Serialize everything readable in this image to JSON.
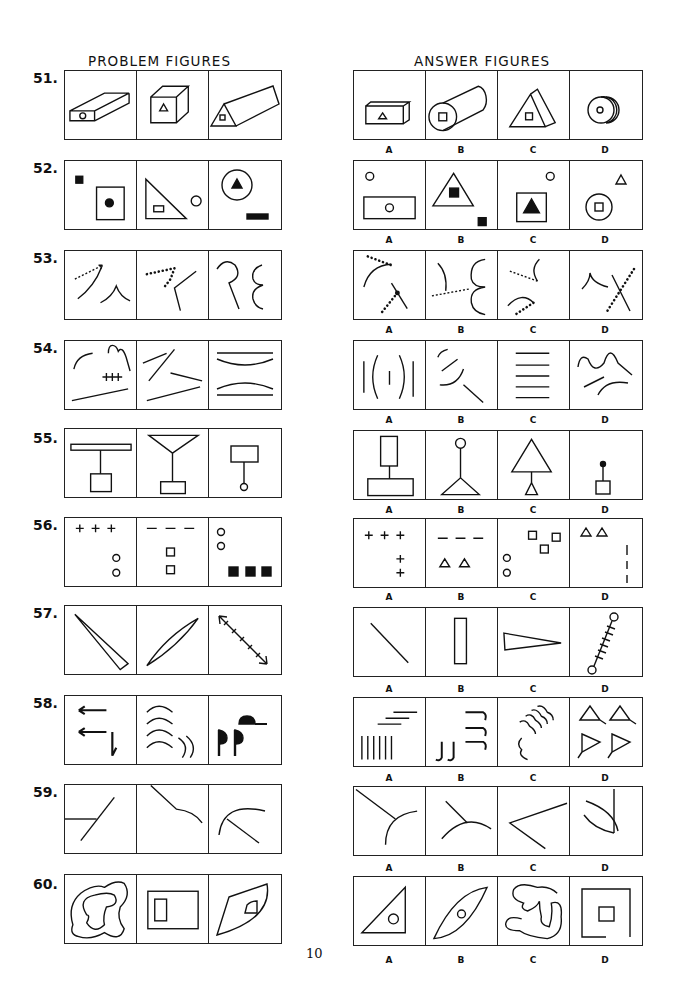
{
  "headers": {
    "problem": "PROBLEM FIGURES",
    "answer": "ANSWER FIGURES"
  },
  "page_number": "10",
  "answer_labels": [
    "A",
    "B",
    "C",
    "D"
  ],
  "questions": [
    {
      "number": "51.",
      "problem": [
        "flat box with circle on end face",
        "cube with triangle on front face",
        "triangular prism with square on end face"
      ],
      "answers": [
        "box with triangle",
        "cylinder with square on end",
        "triangular prism with square",
        "disc with circle"
      ]
    },
    {
      "number": "52.",
      "problem": [
        "small black square; square with black dot",
        "triangle with small rectangle; small circle",
        "circle with black triangle; black bar"
      ],
      "answers": [
        "circle; rectangle with circle",
        "triangle with black square; black square",
        "circle; square with black triangle",
        "triangle; circle with square"
      ]
    },
    {
      "number": "53.",
      "problem": [
        "dashed arrow, arc, peak",
        "dotted angle, bent line",
        "R-curve, epsilon curve"
      ],
      "answers": [
        "dotted arc, dotted line across line",
        "arc, dashed line, double arc",
        "dashed line with arc, dotted arc",
        "peak arc, dotted line across line"
      ]
    },
    {
      "number": "54.",
      "problem": [
        "arc, squiggle, hatched line, long line",
        "crossed lines, two lines",
        "lines with arcs"
      ],
      "answers": [
        "vertical lines and parentheses",
        "arcs and lines",
        "five horizontal lines",
        "wave and arcs"
      ]
    },
    {
      "number": "55.",
      "problem": [
        "bar on stem to square",
        "funnel on stem to rectangle",
        "rectangle on stem to circle"
      ],
      "answers": [
        "rectangle on stem to wide rectangle",
        "circle on stem to triangle",
        "triangle on stem to small triangle",
        "dot on stem to square"
      ]
    },
    {
      "number": "56.",
      "problem": [
        "three plus signs; two circles",
        "three dashes; two squares",
        "two circles; three black squares"
      ],
      "answers": [
        "three plus; two plus",
        "three dashes; two triangles",
        "three squares; two circles",
        "two triangles; three vertical bars"
      ]
    },
    {
      "number": "57.",
      "problem": [
        "thin wedge diagonal",
        "thin ellipse diagonal",
        "double-headed hatched arrow"
      ],
      "answers": [
        "diagonal line",
        "vertical rectangle",
        "horizontal wedge",
        "hatched line with circles"
      ]
    },
    {
      "number": "58.",
      "problem": [
        "hook strokes",
        "stacked arcs",
        "black flag shapes"
      ],
      "answers": [
        "stepped lines and vertical bars",
        "J shapes",
        "wavy strokes",
        "four triangles with tails"
      ]
    },
    {
      "number": "59.",
      "problem": [
        "line crossing a line",
        "line joining curve",
        "line meeting arc"
      ],
      "answers": [
        "line to arc",
        "line to arc top",
        "open angle",
        "arc crossing vertical line"
      ]
    },
    {
      "number": "60.",
      "problem": [
        "nested blobs",
        "rectangle within rectangle",
        "curved shape with inner shape"
      ],
      "answers": [
        "triangle with circle",
        "ellipse with circle",
        "wavy blob",
        "open square with square"
      ]
    }
  ]
}
